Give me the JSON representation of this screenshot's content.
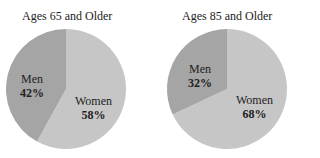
{
  "chart_data": [
    {
      "type": "pie",
      "title": "Ages 65 and Older",
      "categories": [
        "Men",
        "Women"
      ],
      "values": [
        42,
        58
      ],
      "labels": [
        "42%",
        "58%"
      ],
      "colors": [
        "#a5a5a5",
        "#c6c6c6"
      ]
    },
    {
      "type": "pie",
      "title": "Ages 85 and Older",
      "categories": [
        "Men",
        "Women"
      ],
      "values": [
        32,
        68
      ],
      "labels": [
        "32%",
        "68%"
      ],
      "colors": [
        "#a5a5a5",
        "#c6c6c6"
      ]
    }
  ]
}
